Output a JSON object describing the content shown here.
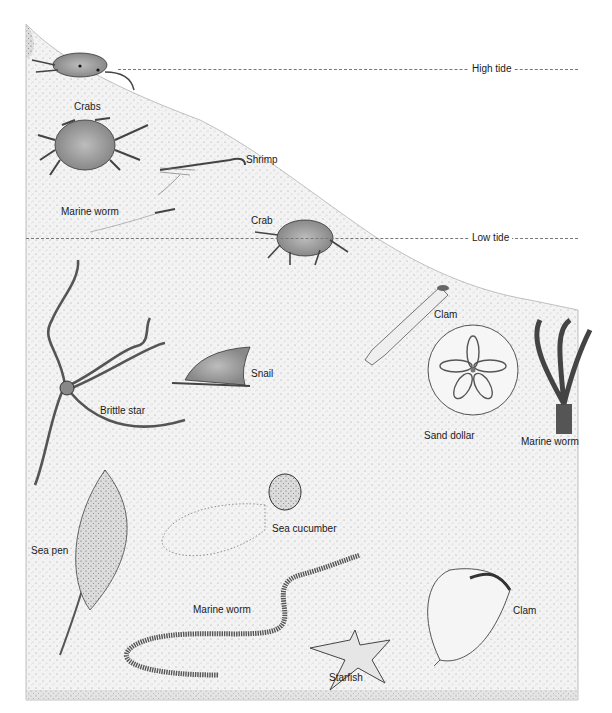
{
  "diagram": {
    "type": "intertidal zone illustration",
    "background_color": "#ffffff",
    "sand_color": "#e9e9e9",
    "ink_color": "#3a3a3a"
  },
  "tide_lines": {
    "high": {
      "label": "High tide",
      "y": 69
    },
    "low": {
      "label": "Low tide",
      "y": 238
    }
  },
  "labels": {
    "crabs": "Crabs",
    "shrimp": "Shrimp",
    "marine_worm_top": "Marine worm",
    "crab": "Crab",
    "clam_tube": "Clam",
    "snail": "Snail",
    "brittle_star": "Brittle star",
    "sand_dollar": "Sand dollar",
    "marine_worm_tube": "Marine worm",
    "sea_cucumber": "Sea cucumber",
    "sea_pen": "Sea pen",
    "marine_worm_bottom": "Marine worm",
    "clam_shell": "Clam",
    "starfish": "Starfish"
  }
}
